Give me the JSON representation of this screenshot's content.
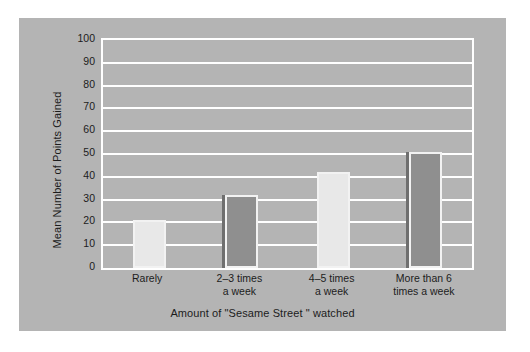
{
  "chart_data": {
    "type": "bar",
    "title": "",
    "xlabel": "Amount of  \"Sesame Street \" watched",
    "ylabel": "Mean Number of Points Gained",
    "categories": [
      "Rarely",
      "2–3 times\na week",
      "4–5 times\na week",
      "More than 6\ntimes a week"
    ],
    "category_lines": [
      [
        "Rarely"
      ],
      [
        "2–3 times",
        "a week"
      ],
      [
        "4–5 times",
        "a week"
      ],
      [
        "More than 6",
        "times a week"
      ]
    ],
    "values": [
      21,
      32,
      42,
      51
    ],
    "ylim": [
      0,
      100
    ],
    "yticks": [
      0,
      10,
      20,
      30,
      40,
      50,
      60,
      70,
      80,
      90,
      100
    ],
    "ytick_labels": [
      "0",
      "10",
      "20",
      "30",
      "40",
      "50",
      "60",
      "70",
      "80",
      "90",
      "100"
    ],
    "grid": true,
    "legend": false,
    "bar_styles": [
      "light",
      "dark",
      "light",
      "dark"
    ],
    "colors": {
      "panel_background": "#b4b4b4",
      "figure_background": "#ffffff",
      "gridline": "#ffffff",
      "axis": "#ffffff",
      "bar_light": "#e8e8e8",
      "bar_dark": "#8f8f8f",
      "bar_edge": "#f2f2f2",
      "bar_shadow": "#6f6f6f",
      "text": "#1c1c1c"
    }
  }
}
